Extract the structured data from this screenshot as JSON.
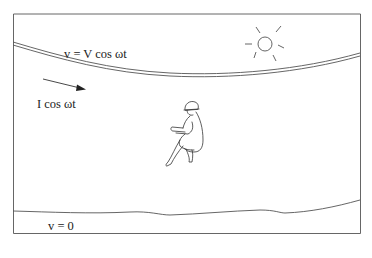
{
  "diagram": {
    "labels": {
      "wire_voltage": "v = V cos ωt",
      "current": "I cos ωt",
      "ground_voltage": "v = 0"
    },
    "icons": {
      "sun": "sun-icon",
      "person": "seated-person-figure",
      "current_arrow": "arrow-right-icon"
    },
    "colors": {
      "line": "#555555",
      "text": "#222222",
      "background": "#ffffff"
    }
  }
}
